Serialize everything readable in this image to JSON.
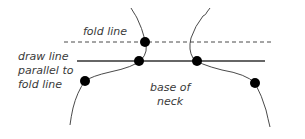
{
  "diagram": {
    "colors": {
      "background": "#ffffff",
      "line": "#4a4a4a",
      "dot": "#000000",
      "text": "#3a3a3a"
    },
    "labels": {
      "fold_line": "fold line",
      "draw_line": {
        "line1": "draw line",
        "line2": "parallel to",
        "line3": "fold line"
      },
      "base_of_neck": {
        "line1": "base of",
        "line2": "neck"
      }
    },
    "lines": {
      "fold_line": {
        "style": "dashed",
        "x1": 64,
        "x2": 272,
        "y": 42
      },
      "draw_line": {
        "style": "solid",
        "x1": 77,
        "x2": 265,
        "y": 61
      }
    },
    "points": [
      {
        "name": "fold-left",
        "x": 145,
        "y": 42
      },
      {
        "name": "draw-left",
        "x": 139,
        "y": 61
      },
      {
        "name": "draw-right",
        "x": 197,
        "y": 61
      },
      {
        "name": "shoulder-left",
        "x": 85,
        "y": 81
      },
      {
        "name": "shoulder-right",
        "x": 255,
        "y": 83
      }
    ]
  }
}
